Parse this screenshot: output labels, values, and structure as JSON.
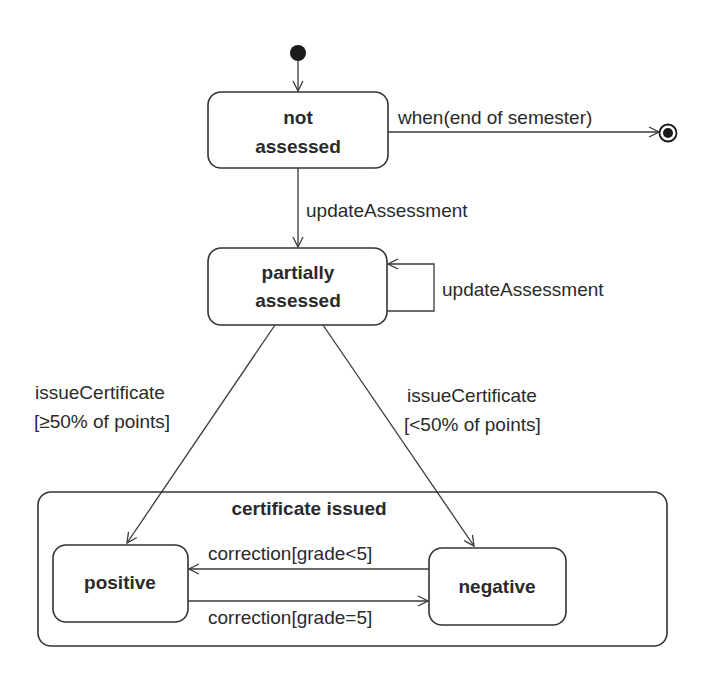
{
  "diagram": {
    "type": "UML state machine diagram",
    "colors": {
      "line": "#333333",
      "text": "#2a2a2a",
      "background": "#ffffff"
    },
    "states": {
      "initial": {
        "kind": "initial-pseudostate"
      },
      "not_assessed": {
        "line1": "not",
        "line2": "assessed"
      },
      "partially_assessed": {
        "line1": "partially",
        "line2": "assessed"
      },
      "certificate_issued": {
        "label": "certificate issued",
        "substates": {
          "positive": {
            "label": "positive"
          },
          "negative": {
            "label": "negative"
          }
        }
      },
      "final": {
        "kind": "final-state"
      }
    },
    "transitions": {
      "init_to_not_assessed": {
        "label": ""
      },
      "not_assessed_to_final": {
        "label": "when(end of semester)"
      },
      "not_assessed_to_partially": {
        "label": "updateAssessment"
      },
      "partially_self_loop": {
        "label": "updateAssessment"
      },
      "partially_to_positive": {
        "line1": "issueCertificate",
        "line2": "[≥50% of points]"
      },
      "partially_to_negative": {
        "line1": "issueCertificate",
        "line2": "[<50% of points]"
      },
      "negative_to_positive": {
        "label": "correction[grade<5]"
      },
      "positive_to_negative": {
        "label": "correction[grade=5]"
      }
    }
  }
}
